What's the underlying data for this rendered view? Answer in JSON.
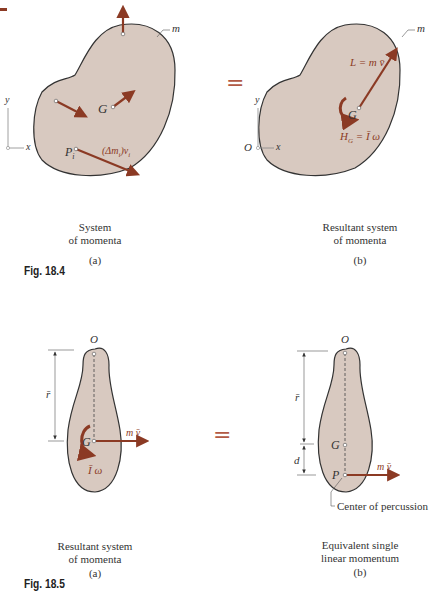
{
  "colors": {
    "body_fill": "#d8c9c0",
    "outline": "#333333",
    "vector": "#8b3a24",
    "label_vector": "#8b3a24"
  },
  "fig_18_4": {
    "label": "Fig. 18.4",
    "equals": "=",
    "a": {
      "labels": {
        "m": "m",
        "G": "G",
        "P": "P",
        "P_sub": "i",
        "momentum": "(Δm",
        "momentum_sub": "i",
        "momentum_tail": ")v",
        "v_sub": "i",
        "y": "y",
        "x": "x",
        "O": "O"
      },
      "caption_line1": "System",
      "caption_line2": "of momenta",
      "sub": "(a)"
    },
    "b": {
      "labels": {
        "m": "m",
        "G": "G",
        "L": "L = m v̄",
        "H": "H",
        "H_sub": "G",
        "H_tail": " = Ī ω",
        "y": "y",
        "x": "x",
        "O": "O"
      },
      "caption_line1": "Resultant system",
      "caption_line2": "of momenta",
      "sub": "(b)"
    }
  },
  "fig_18_5": {
    "label": "Fig. 18.5",
    "equals": "=",
    "a": {
      "labels": {
        "O": "O",
        "G": "G",
        "rbar": "r̄",
        "mv": "m v̄",
        "Iw": "Ī ω"
      },
      "caption_line1": "Resultant system",
      "caption_line2": "of momenta",
      "sub": "(a)"
    },
    "b": {
      "labels": {
        "O": "O",
        "G": "G",
        "P": "P",
        "rbar": "r̄",
        "d": "d",
        "mv": "m v̄",
        "center": "Center of percussion"
      },
      "caption_line1": "Equivalent single",
      "caption_line2": "linear momentum",
      "sub": "(b)"
    }
  }
}
